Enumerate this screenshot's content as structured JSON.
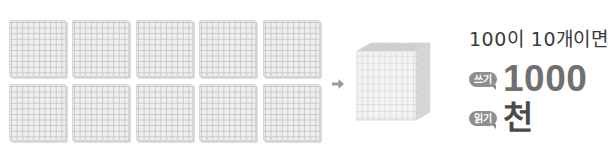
{
  "diagram": {
    "type": "base-ten-blocks",
    "left_group": {
      "description": "hundreds flats",
      "count": 10,
      "rows": 2,
      "per_row": 5,
      "flat_grid": "10x10"
    },
    "arrow": {
      "icon": "arrow-right-icon",
      "color": "#9a9a9a"
    },
    "right_shape": {
      "description": "thousand cube",
      "grid": "10x10x10"
    }
  },
  "text": {
    "title": "100이 10개이면",
    "write": {
      "badge": "쓰기",
      "value": "1000"
    },
    "read": {
      "badge": "읽기",
      "value": "천"
    }
  },
  "colors": {
    "block_fill": "#efefef",
    "block_grid": "#c8c8c8",
    "badge_bg": "#8e8e8e",
    "title_text": "#3a3a3a",
    "write_value_text": "#707070",
    "read_value_text": "#4a4a4a"
  }
}
